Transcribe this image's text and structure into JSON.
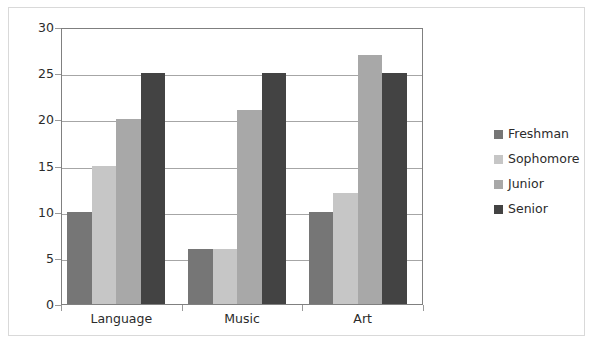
{
  "chart_data": {
    "type": "bar",
    "title": "",
    "subtitle": "",
    "xlabel": "",
    "ylabel": "",
    "categories": [
      "Language",
      "Music",
      "Art"
    ],
    "series": [
      {
        "name": "Freshman",
        "color": "#767676",
        "values": [
          10,
          6,
          10
        ]
      },
      {
        "name": "Sophomore",
        "color": "#c6c6c6",
        "values": [
          15,
          6,
          12
        ]
      },
      {
        "name": "Junior",
        "color": "#a8a8a8",
        "values": [
          20,
          21,
          27
        ]
      },
      {
        "name": "Senior",
        "color": "#434343",
        "values": [
          25,
          25,
          25
        ]
      }
    ],
    "ylim": [
      0,
      30
    ],
    "ytick_labels": [
      "0",
      "5",
      "10",
      "15",
      "20",
      "25",
      "30"
    ],
    "ytick_values": [
      0,
      5,
      10,
      15,
      20,
      25,
      30
    ],
    "grid": true,
    "legend_position": "right",
    "annotations": []
  },
  "colors": {
    "plot_border": "#808080",
    "gridline": "#a6a6a6",
    "outer_frame": "#d9d9d9",
    "text": "#2b2b2b",
    "background": "#ffffff"
  }
}
